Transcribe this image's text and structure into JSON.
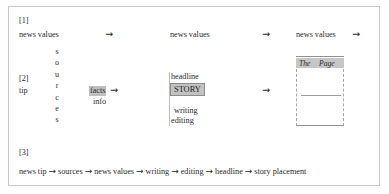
{
  "figure": {
    "border_color": "#c9c9c9",
    "accent_highlight": "#bfbfbf"
  },
  "sections": {
    "one": {
      "marker": "[1]",
      "stage_1_label": "news values",
      "arrow_1": "→",
      "stage_2_label": "news values",
      "arrow_2": "→",
      "stage_3_label": "news values",
      "arrow_3": "→"
    },
    "two": {
      "marker": "[2]",
      "tip_label": "tip",
      "sources_letters": [
        "s",
        "o",
        "u",
        "r",
        "c",
        "e",
        "s"
      ],
      "facts_label": "facts",
      "facts_arrow": "→",
      "info_label": "info",
      "headline_label": "headline",
      "story_label": "STORY",
      "writing_label": "writing",
      "editing_label": "editing",
      "to_paper_arrow": "→",
      "paper": {
        "masthead_word_1": "The",
        "masthead_word_2": "Page"
      }
    },
    "three": {
      "marker": "[3]",
      "chain": [
        "news tip",
        "sources",
        "news values",
        "writing",
        "editing",
        "headline",
        "story placement"
      ],
      "separator": "→"
    }
  }
}
